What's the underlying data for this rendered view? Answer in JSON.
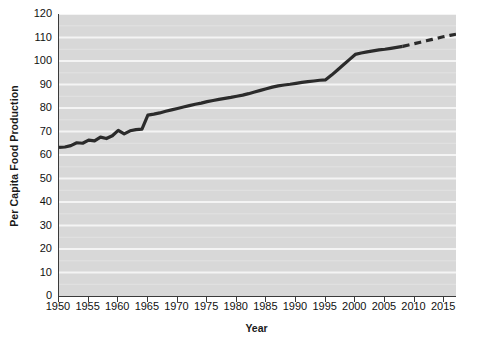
{
  "chart_data": {
    "type": "line",
    "title": "",
    "xlabel": "Year",
    "ylabel": "Per Capita Food Production",
    "xlim": [
      1950,
      2017
    ],
    "ylim": [
      0,
      120
    ],
    "grid": true,
    "legend": false,
    "y_ticks": [
      0,
      10,
      20,
      30,
      40,
      50,
      60,
      70,
      80,
      90,
      100,
      110,
      120
    ],
    "x_ticks": [
      1950,
      1955,
      1960,
      1965,
      1970,
      1975,
      1980,
      1985,
      1990,
      1995,
      2000,
      2005,
      2010,
      2015
    ],
    "minor_gridline_step": 5,
    "line_color": "#2b2b2b",
    "plot_background": "#d8d8d8",
    "gridline_color": "#f4f4f4",
    "series": [
      {
        "name": "Per Capita Food Production (observed)",
        "style": "solid",
        "x": [
          1950,
          1951,
          1952,
          1953,
          1954,
          1955,
          1956,
          1957,
          1958,
          1959,
          1960,
          1961,
          1962,
          1963,
          1964,
          1965,
          1966,
          1967,
          1968,
          1969,
          1970,
          1971,
          1972,
          1973,
          1974,
          1975,
          1976,
          1977,
          1978,
          1979,
          1980,
          1981,
          1982,
          1983,
          1984,
          1985,
          1986,
          1987,
          1988,
          1989,
          1990,
          1991,
          1992,
          1993,
          1994,
          1995,
          1996,
          1997,
          1998,
          1999,
          2000,
          2001,
          2002,
          2003,
          2004,
          2005,
          2006,
          2007,
          2008
        ],
        "y": [
          63.2,
          63.4,
          64.0,
          65.2,
          65.0,
          66.3,
          66.0,
          67.6,
          67.0,
          68.2,
          70.5,
          69.0,
          70.3,
          70.8,
          71.0,
          77.0,
          77.4,
          77.9,
          78.6,
          79.2,
          79.8,
          80.4,
          81.0,
          81.6,
          82.1,
          82.7,
          83.2,
          83.7,
          84.1,
          84.5,
          85.0,
          85.5,
          86.1,
          86.8,
          87.5,
          88.2,
          88.9,
          89.4,
          89.8,
          90.1,
          90.5,
          90.9,
          91.2,
          91.5,
          91.8,
          92.0,
          94.0,
          96.2,
          98.4,
          100.6,
          102.8,
          103.4,
          103.9,
          104.3,
          104.7,
          105.0,
          105.4,
          105.8,
          106.2
        ]
      },
      {
        "name": "Per Capita Food Production (projected)",
        "style": "dashed",
        "x": [
          2008,
          2009,
          2010,
          2011,
          2012,
          2013,
          2014,
          2015,
          2016,
          2017
        ],
        "y": [
          106.2,
          106.8,
          107.4,
          108.0,
          108.6,
          109.2,
          109.8,
          110.4,
          110.9,
          111.4
        ]
      }
    ]
  }
}
